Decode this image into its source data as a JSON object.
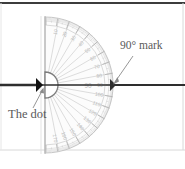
{
  "figure": {
    "type": "protractor-diagram",
    "width": 185,
    "height": 169,
    "background": "#ffffff",
    "border_top_color": "#3c3c3c",
    "border_faint_color": "#cfcfcf"
  },
  "annotations": {
    "dot_label": "The dot",
    "angle_label": "90° mark"
  },
  "protractor": {
    "center_x": 46,
    "center_y": 85,
    "outer_radius": 68,
    "inner_hole_radius": 13,
    "tick_band_inner_radius": 60,
    "flat_edge_x": 45,
    "flat_edge_top_y": 16,
    "flat_edge_bottom_y": 154,
    "body_color": "#c8c8c8",
    "tick_color": "#bdbdbd",
    "ray_color": "#c4c4c4",
    "center_number": "90",
    "degree_labels": [
      "10",
      "20",
      "30",
      "40",
      "50",
      "60",
      "70",
      "80",
      "90",
      "100",
      "110",
      "120",
      "130",
      "140",
      "150",
      "160",
      "170"
    ]
  },
  "baseline": {
    "color": "#2e2e2e",
    "y": 85,
    "x_start": 0,
    "x_end": 185,
    "dot_marker_x": 38,
    "dot_marker_color": "#111111"
  },
  "leaders": {
    "dot_leader": {
      "from_x": 33,
      "from_y": 110,
      "to_x": 42,
      "to_y": 90
    },
    "angle_leader": {
      "from_x": 134,
      "from_y": 55,
      "to_x": 113,
      "to_y": 84
    },
    "color": "#8a8a8a"
  }
}
